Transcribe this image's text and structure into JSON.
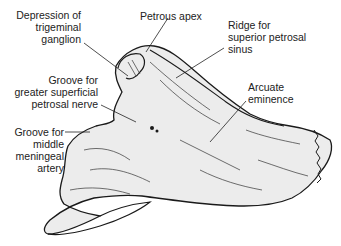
{
  "diagram": {
    "colors": {
      "bone_fill": "#ececec",
      "outline": "#1a1a1a",
      "leader": "#222222",
      "text": "#222222",
      "background": "#ffffff"
    },
    "labels": [
      {
        "id": "depression-trigeminal",
        "text": "Depression of\ntrigeminal\nganglion"
      },
      {
        "id": "petrous-apex",
        "text": "Petrous apex"
      },
      {
        "id": "ridge-superior-petrosal",
        "text": "Ridge for\nsuperior petrosal\nsinus"
      },
      {
        "id": "groove-greater-petrosal",
        "text": "Groove for\ngreater superficial\npetrosal nerve"
      },
      {
        "id": "arcuate-eminence",
        "text": "Arcuate\neminence"
      },
      {
        "id": "groove-middle-meningeal",
        "text": "Groove for\nmiddle\nmeningeal\nartery"
      }
    ]
  }
}
